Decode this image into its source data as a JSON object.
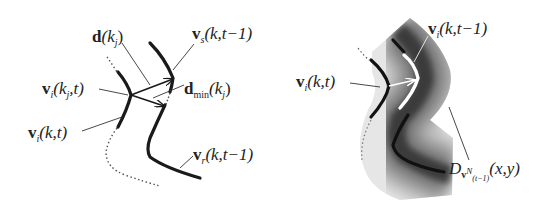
{
  "left_panel": {
    "labels": {
      "d_kj": {
        "vec": "d",
        "args": "(k",
        "sub": "j",
        "close": ")"
      },
      "vs_prev": {
        "vec": "v",
        "sub": "s",
        "args": "(k,t−1)"
      },
      "dmin": {
        "vec": "d",
        "sub": "min",
        "args": "(k",
        "sub2": "j",
        "close": ")"
      },
      "vi_kj_t": {
        "vec": "v",
        "sub": "i",
        "args": "(k",
        "sub2": "j",
        "close": ",t)"
      },
      "vi_kt": {
        "vec": "v",
        "sub": "i",
        "args": "(k,t)"
      },
      "vr_prev": {
        "vec": "v",
        "sub": "r",
        "args": "(k,t−1)"
      }
    },
    "curves": [
      "v_i(k,t) solid thick",
      "v_s(k,t-1) solid thick",
      "v_r(k,t-1) solid thick",
      "dotted continuation curves"
    ],
    "arrows": [
      "d(k_j)",
      "d_min(k_j)"
    ]
  },
  "right_panel": {
    "labels": {
      "vi_prev": {
        "vec": "v",
        "sub": "i",
        "args": "(k,t−1)"
      },
      "vi_kt": {
        "vec": "v",
        "sub": "i",
        "args": "(k,t)"
      },
      "distance_map": {
        "name": "D",
        "sub_vec": "v",
        "sup": "N",
        "subsub": "(t−1)",
        "args": "(x,y)"
      }
    },
    "description": "grayscale distance map band around previous contour with white previous contour and black current contour"
  },
  "colors": {
    "stroke": "#1a1a1a",
    "text": "#222222",
    "map_dark": "#2a2a2a",
    "map_light": "#d8d8d8",
    "prev_contour_white": "#ffffff"
  }
}
